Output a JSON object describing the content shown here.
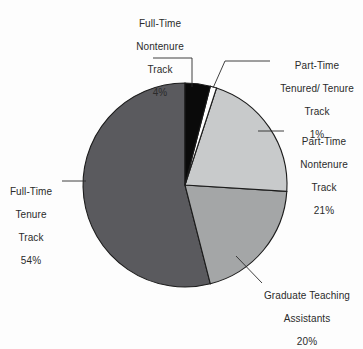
{
  "chart_data": {
    "type": "pie",
    "title": "",
    "subtitle": "",
    "xlabel": "",
    "ylabel": "",
    "legend_position": "callout-labels",
    "grid": false,
    "start_angle_deg": 0,
    "direction": "clockwise",
    "categories": [
      "Full-Time Nontenure Track",
      "Part-Time Tenured/ Tenure Track",
      "Part-Time Nontenure Track",
      "Graduate Teaching Assistants",
      "Full-Time Tenure Track"
    ],
    "values": [
      4,
      1,
      21,
      20,
      54
    ],
    "value_labels": [
      "4%",
      "1%",
      "21%",
      "20%",
      "54%"
    ],
    "colors": [
      "#0a0a0a",
      "#ffffff",
      "#c8cacb",
      "#a4a6a7",
      "#5a5a5e"
    ],
    "slice_border_color": "#1c1c1c",
    "background_color": "#fdfdfd",
    "text_color": "#2b2b2b"
  },
  "callouts": {
    "full_time_nontenure": {
      "line1": "Full-Time",
      "line2": "Nontenure",
      "line3": "Track",
      "percent": "4%"
    },
    "part_time_tenured": {
      "line1": "Part-Time",
      "line2": "Tenured/ Tenure",
      "line3": "Track",
      "percent": "1%"
    },
    "part_time_nontenure": {
      "line1": "Part-Time",
      "line2": "Nontenure",
      "line3": "Track",
      "percent": "21%"
    },
    "graduate_teaching": {
      "line1": "Graduate Teaching",
      "line2": "Assistants",
      "percent": "20%"
    },
    "full_time_tenure": {
      "line1": "Full-Time",
      "line2": "Tenure",
      "line3": "Track",
      "percent": "54%"
    }
  }
}
